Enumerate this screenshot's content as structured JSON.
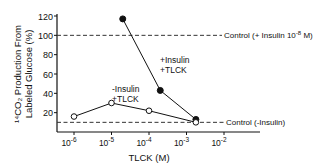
{
  "chart_data": {
    "type": "line",
    "title": "",
    "xlabel": "TLCK (M)",
    "ylabel_line1": "¹⁴CO₂ Production From",
    "ylabel_line2": "Labeled Glucose (%)",
    "xscale": "log",
    "xlim": [
      1e-06,
      0.01
    ],
    "ylim": [
      0,
      120
    ],
    "x_ticks": [
      {
        "value": -6,
        "label": "10",
        "exp": "-6"
      },
      {
        "value": -5,
        "label": "10",
        "exp": "-5"
      },
      {
        "value": -4,
        "label": "10",
        "exp": "-4"
      },
      {
        "value": -3,
        "label": "10",
        "exp": "-3"
      },
      {
        "value": -2,
        "label": "10",
        "exp": "-2"
      }
    ],
    "y_ticks": [
      20,
      40,
      60,
      80,
      100,
      120
    ],
    "grid": false,
    "series": [
      {
        "name": "+Insulin +TLCK",
        "label_line1": "+Insulin",
        "label_line2": "+TLCK",
        "marker": "filled-circle",
        "points": [
          {
            "log_x": -4.7,
            "y": 117
          },
          {
            "log_x": -3.7,
            "y": 43
          },
          {
            "log_x": -2.75,
            "y": 13
          }
        ]
      },
      {
        "name": "-Insulin +TLCK",
        "label_line1": "-Insulin",
        "label_line2": "+TLCK",
        "marker": "open-circle",
        "points": [
          {
            "log_x": -6,
            "y": 16
          },
          {
            "log_x": -5,
            "y": 30
          },
          {
            "log_x": -4,
            "y": 22
          },
          {
            "log_x": -2.75,
            "y": 10
          }
        ]
      }
    ],
    "reference_lines": [
      {
        "name": "Control (+Insulin 10^-8 M)",
        "label": "Control (+ Insulin 10",
        "label_exp": "-8",
        "label_tail": " M)",
        "y": 100,
        "style": "dashed"
      },
      {
        "name": "Control (-Insulin)",
        "label": "Control (-Insulin)",
        "y": 10,
        "style": "dashed"
      }
    ]
  }
}
